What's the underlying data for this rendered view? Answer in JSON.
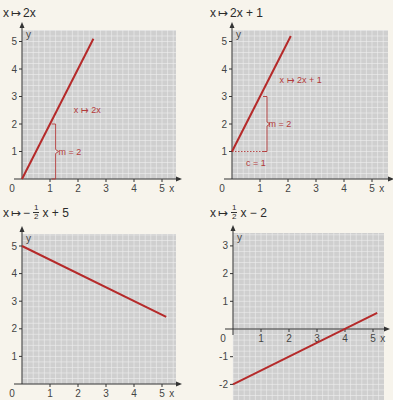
{
  "colors": {
    "background": "#f7f4ec",
    "grid_fill": "#cfcfcf",
    "grid_line": "#efefef",
    "axis": "#333333",
    "line": "#b52a2a",
    "annotation": "#b33a3a"
  },
  "chart_data": [
    {
      "type": "line",
      "title": "x ↦ 2x",
      "function": "2x",
      "xlabel": "x",
      "ylabel": "y",
      "xlim": [
        0,
        5.4
      ],
      "ylim": [
        0,
        5.4
      ],
      "xticks": [
        1,
        2,
        3,
        4,
        5
      ],
      "yticks": [
        1,
        2,
        3,
        4,
        5
      ],
      "origin_label": "0",
      "grid": true,
      "series": [
        {
          "name": "x ↦ 2x",
          "x": [
            0,
            2.55
          ],
          "y": [
            0,
            5.1
          ]
        }
      ],
      "annotations": [
        {
          "text": "x ↦ 2x",
          "x": 1.85,
          "y": 2.5
        },
        {
          "text": "m = 2",
          "x": 1.3,
          "y": 1.0,
          "type": "brace",
          "from": [
            1.2,
            0
          ],
          "to": [
            1.2,
            2
          ]
        }
      ]
    },
    {
      "type": "line",
      "title": "x ↦ 2x + 1",
      "function": "2x + 1",
      "xlabel": "x",
      "ylabel": "y",
      "xlim": [
        0,
        5.4
      ],
      "ylim": [
        0,
        5.4
      ],
      "xticks": [
        1,
        2,
        3,
        4,
        5
      ],
      "yticks": [
        1,
        2,
        3,
        4,
        5
      ],
      "origin_label": "0",
      "grid": true,
      "series": [
        {
          "name": "x ↦ 2x + 1",
          "x": [
            0,
            2.1
          ],
          "y": [
            1,
            5.2
          ]
        }
      ],
      "annotations": [
        {
          "text": "x ↦ 2x + 1",
          "x": 1.7,
          "y": 3.6
        },
        {
          "text": "m = 2",
          "x": 1.3,
          "y": 2.0,
          "type": "brace",
          "from": [
            1.25,
            1
          ],
          "to": [
            1.25,
            3
          ]
        },
        {
          "text": "c = 1",
          "x": 0.5,
          "y": 0.6,
          "type": "dotted",
          "from": [
            0,
            1
          ],
          "to": [
            1.25,
            1
          ]
        }
      ]
    },
    {
      "type": "line",
      "title": "x ↦ −½x + 5",
      "function": "-1/2 x + 5",
      "xlabel": "x",
      "ylabel": "y",
      "xlim": [
        0,
        5.4
      ],
      "ylim": [
        0,
        5.4
      ],
      "xticks": [
        1,
        2,
        3,
        4,
        5
      ],
      "yticks": [
        1,
        2,
        3,
        4,
        5
      ],
      "origin_label": "0",
      "grid": true,
      "series": [
        {
          "name": "x ↦ −½x + 5",
          "x": [
            0,
            5.15
          ],
          "y": [
            5,
            2.43
          ]
        }
      ]
    },
    {
      "type": "line",
      "title": "x ↦ ½x − 2",
      "function": "1/2 x - 2",
      "xlabel": "x",
      "ylabel": "y",
      "xlim": [
        0,
        5.4
      ],
      "ylim": [
        -2.5,
        3.4
      ],
      "xticks": [
        1,
        2,
        3,
        4,
        5
      ],
      "yticks": [
        -2,
        -1,
        1,
        2,
        3
      ],
      "origin_label": "0",
      "grid": true,
      "series": [
        {
          "name": "x ↦ ½x − 2",
          "x": [
            0,
            5.15
          ],
          "y": [
            -2,
            0.58
          ]
        }
      ]
    }
  ],
  "titles": {
    "p1": {
      "lhs": "x",
      "arrow": "↦",
      "rhs": "2x"
    },
    "p2": {
      "lhs": "x",
      "arrow": "↦",
      "rhs": "2x + 1"
    },
    "p3": {
      "lhs": "x",
      "arrow": "↦",
      "sign": "−",
      "num": "1",
      "den": "2",
      "rest": "x + 5"
    },
    "p4": {
      "lhs": "x",
      "arrow": "↦",
      "num": "1",
      "den": "2",
      "rest": "x − 2"
    }
  }
}
